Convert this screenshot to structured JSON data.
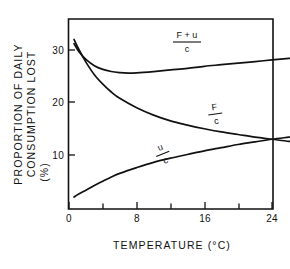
{
  "chart_data": {
    "type": "line",
    "title": "",
    "xlabel": "TEMPERATURE (°C)",
    "ylabel_line1": "PROPORTION OF DAILY",
    "ylabel_line2": "CONSUMPTION LOST",
    "ylabel_line3": "(%)",
    "xlim": [
      0,
      30
    ],
    "ylim": [
      0,
      34
    ],
    "grid": false,
    "legend": "inline-curve-labels",
    "x_ticks_major": [
      0,
      8,
      16,
      24
    ],
    "x_ticks_major_labels": [
      "0",
      "8",
      "16",
      "24"
    ],
    "x_ticks_minor": [
      4,
      12,
      20,
      28
    ],
    "y_ticks_major": [
      10,
      20,
      30
    ],
    "y_ticks_major_labels": [
      "10",
      "20",
      "30"
    ],
    "series": [
      {
        "name": "(F+u)/c",
        "label_numerator": "F + u",
        "label_denominator": "c",
        "x": [
          0.6,
          1.2,
          2,
          3,
          4,
          5,
          6,
          7,
          8,
          10,
          12,
          14,
          16,
          18,
          20,
          22,
          24,
          26,
          27.5
        ],
        "values": [
          31.2,
          29.6,
          28.2,
          27.0,
          26.3,
          25.9,
          25.7,
          25.6,
          25.65,
          25.9,
          26.2,
          26.5,
          26.9,
          27.2,
          27.5,
          27.8,
          28.1,
          28.4,
          28.6
        ]
      },
      {
        "name": "F/c",
        "label_numerator": "F",
        "label_denominator": "c",
        "x": [
          0.6,
          1.2,
          2,
          3,
          4,
          5,
          6,
          8,
          10,
          12,
          14,
          16,
          18,
          20,
          22,
          24,
          26,
          27.5
        ],
        "values": [
          32.0,
          30.0,
          27.7,
          25.3,
          23.5,
          22.0,
          20.8,
          19.0,
          17.6,
          16.5,
          15.7,
          15.0,
          14.4,
          13.9,
          13.4,
          13.0,
          12.6,
          12.4
        ]
      },
      {
        "name": "u/c",
        "label_numerator": "u",
        "label_denominator": "c",
        "x": [
          0.6,
          1.2,
          2,
          3,
          4,
          5,
          6,
          8,
          10,
          12,
          14,
          16,
          18,
          20,
          22,
          24,
          26,
          27.5
        ],
        "values": [
          2.0,
          2.6,
          3.3,
          4.2,
          5.0,
          5.8,
          6.5,
          7.6,
          8.6,
          9.4,
          10.1,
          10.8,
          11.4,
          12.0,
          12.5,
          13.0,
          13.4,
          13.7
        ]
      }
    ],
    "curve_labels": [
      {
        "numerator": "F + u",
        "denominator": "c",
        "x": 14.0,
        "y": 30.6
      },
      {
        "numerator": "F",
        "denominator": "c",
        "x": 18.0,
        "y": 17.8
      },
      {
        "numerator": "u",
        "denominator": "c",
        "x": 10.5,
        "y": 13.3
      }
    ],
    "colors": {
      "axis": "#111111",
      "curve": "#111111",
      "background": "#ffffff"
    }
  }
}
